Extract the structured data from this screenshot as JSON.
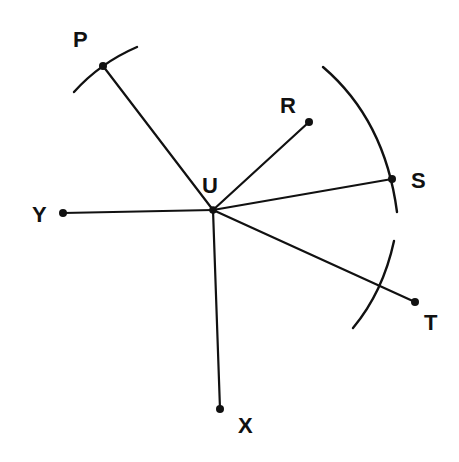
{
  "diagram": {
    "title": "",
    "center": {
      "label": "U",
      "x": 213,
      "y": 210,
      "label_x": 202,
      "label_y": 193
    },
    "points": [
      {
        "label": "P",
        "x": 103,
        "y": 66,
        "label_x": 73,
        "label_y": 47
      },
      {
        "label": "R",
        "x": 309,
        "y": 122,
        "label_x": 280,
        "label_y": 113
      },
      {
        "label": "S",
        "x": 392,
        "y": 179,
        "label_x": 411,
        "label_y": 188
      },
      {
        "label": "T",
        "x": 415,
        "y": 302,
        "label_x": 424,
        "label_y": 330
      },
      {
        "label": "Y",
        "x": 63,
        "y": 213,
        "label_x": 32,
        "label_y": 222
      },
      {
        "label": "X",
        "x": 220,
        "y": 409,
        "label_x": 238,
        "label_y": 433
      }
    ],
    "arcs": [
      {
        "name": "arc-through-p",
        "path": "M 74 92 Q 100 63 137 47"
      },
      {
        "name": "arc-through-s",
        "path": "M 323 67 Q 385 120 397 212"
      },
      {
        "name": "arc-crossing-ut",
        "path": "M 394 241 Q 383 292 353 328"
      }
    ],
    "colors": {
      "ink": "#111111",
      "background": "#ffffff"
    }
  }
}
